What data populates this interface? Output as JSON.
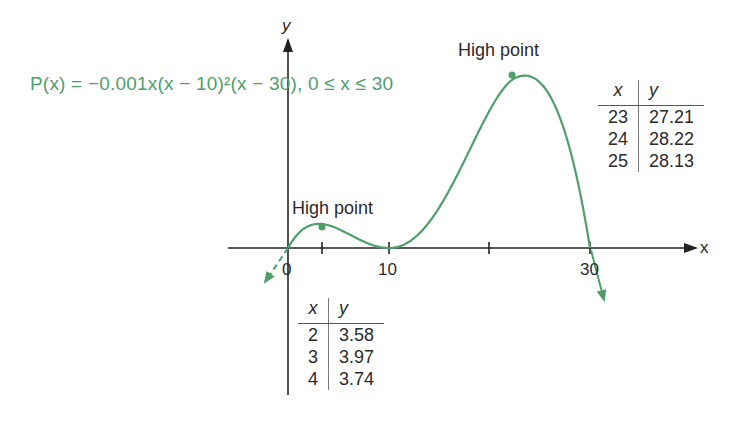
{
  "formula": {
    "text": "P(x) = −0.001x(x − 10)²(x − 30), 0 ≤ x ≤ 30",
    "color": "#4f9e6b"
  },
  "annotations": {
    "high_point_left": "High point",
    "high_point_right": "High point"
  },
  "axes": {
    "x_label": "x",
    "y_label": "y",
    "x_tick_labels": [
      "0",
      "10",
      "30"
    ]
  },
  "table_right": {
    "headers": [
      "x",
      "y"
    ],
    "rows": [
      [
        "23",
        "27.21"
      ],
      [
        "24",
        "28.22"
      ],
      [
        "25",
        "28.13"
      ]
    ]
  },
  "table_left": {
    "headers": [
      "x",
      "y"
    ],
    "rows": [
      [
        "2",
        "3.58"
      ],
      [
        "3",
        "3.97"
      ],
      [
        "4",
        "3.74"
      ]
    ]
  },
  "chart_data": {
    "type": "line",
    "title": "",
    "function": "P(x) = -0.001x(x - 10)^2(x - 30)",
    "domain": [
      0,
      30
    ],
    "xlabel": "x",
    "ylabel": "y",
    "x_ticks": [
      0,
      3.4,
      10,
      20,
      30
    ],
    "x_tick_labels": [
      "0",
      "",
      "10",
      "",
      "30"
    ],
    "xlim": [
      -3,
      41
    ],
    "ylim": [
      -8,
      36
    ],
    "grid": false,
    "series": [
      {
        "name": "P(x)",
        "color": "#4f9e6b",
        "x": [
          0,
          2,
          3,
          4,
          6,
          8,
          10,
          12,
          14,
          16,
          18,
          20,
          22,
          23,
          24,
          25,
          26,
          28,
          30
        ],
        "y": [
          0,
          3.58,
          3.97,
          3.74,
          2.88,
          1.76,
          0,
          2.59,
          6.37,
          10.4,
          14.11,
          17.0,
          18.43,
          27.21,
          28.22,
          28.13,
          26.46,
          18.14,
          0
        ]
      }
    ],
    "highlighted_points": [
      {
        "label": "High point",
        "x": 3.33,
        "y": 3.97
      },
      {
        "label": "High point",
        "x": 23.33,
        "y": 28.22
      }
    ],
    "tables": [
      {
        "headers": [
          "x",
          "y"
        ],
        "rows": [
          [
            23,
            27.21
          ],
          [
            24,
            28.22
          ],
          [
            25,
            28.13
          ]
        ]
      },
      {
        "headers": [
          "x",
          "y"
        ],
        "rows": [
          [
            2,
            3.58
          ],
          [
            3,
            3.97
          ],
          [
            4,
            3.74
          ]
        ]
      }
    ]
  }
}
